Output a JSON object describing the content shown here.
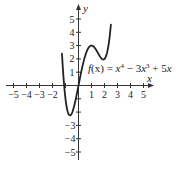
{
  "chart_data": {
    "type": "line",
    "title": "",
    "function_label": "f(x) = x^4 - 3x^3 + 5x",
    "xlabel": "x",
    "ylabel": "y",
    "xlim": [
      -5.5,
      5.6
    ],
    "ylim": [
      -5.5,
      5.8
    ],
    "x_ticks": [
      -5,
      -4,
      -3,
      -2,
      -1,
      1,
      2,
      3,
      4,
      5
    ],
    "x_tick_labels": [
      "-5",
      "-4",
      "-3",
      "-2",
      "1",
      "2",
      "3",
      "4",
      "5"
    ],
    "y_ticks": [
      -5,
      -4,
      -3,
      -2,
      -1,
      1,
      2,
      3,
      4,
      5
    ],
    "y_tick_labels": [
      "-5",
      "-4",
      "-3",
      "1",
      "2",
      "3",
      "4",
      "5"
    ],
    "grid": false,
    "series": [
      {
        "name": "f(x) = x^4 - 3x^3 + 5x",
        "x": [
          -1.26,
          -1.0,
          -0.8,
          -0.7,
          -0.6,
          -0.4,
          -0.2,
          0.0,
          0.2,
          0.4,
          0.6,
          0.8,
          1.0,
          1.2,
          1.4,
          1.6,
          1.8,
          2.0,
          2.2,
          2.4,
          2.48
        ],
        "values": [
          5.0,
          3.0,
          -0.39,
          -1.23,
          -1.7,
          -1.78,
          -0.97,
          0.0,
          0.98,
          1.83,
          2.48,
          2.88,
          3.0,
          2.89,
          2.61,
          2.26,
          2.01,
          2.0,
          2.48,
          3.72,
          4.46
        ]
      }
    ],
    "key_points": {
      "local_min_left": [
        -0.5,
        -1.8
      ],
      "local_max": [
        1.0,
        3.0
      ],
      "local_min_right": [
        1.9,
        2.0
      ]
    }
  },
  "axes": {
    "x_label": "x",
    "y_label": "y",
    "x_tick_text": [
      "−5",
      "−4",
      "−3",
      "−2",
      "1",
      "2",
      "3",
      "4",
      "5"
    ],
    "y_tick_text_pos": [
      "1",
      "2",
      "3",
      "4",
      "5"
    ],
    "y_tick_text_neg": [
      "−3",
      "−4",
      "−5"
    ]
  },
  "labels": {
    "f": "f",
    "paren_x": "(x)",
    "eq": " = ",
    "x4": "x",
    "exp4": "4",
    "minus": " − 3",
    "x3": "x",
    "exp3": "3",
    "plus": " + 5",
    "x1": "x"
  }
}
